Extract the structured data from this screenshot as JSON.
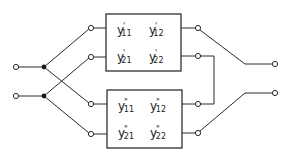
{
  "diagram": {
    "colors": {
      "line": "#2a2a2a",
      "background": "#ffffff"
    },
    "top_network": {
      "name": "two-port-1",
      "prime": "'",
      "params": [
        {
          "base": "y",
          "prime": "'",
          "index": "11"
        },
        {
          "base": "y",
          "prime": "'",
          "index": "12"
        },
        {
          "base": "y",
          "prime": "'",
          "index": "21"
        },
        {
          "base": "y",
          "prime": "'",
          "index": "22"
        }
      ]
    },
    "bottom_network": {
      "name": "two-port-2",
      "prime": "\"",
      "params": [
        {
          "base": "y",
          "prime": "\"",
          "index": "11"
        },
        {
          "base": "y",
          "prime": "\"",
          "index": "12"
        },
        {
          "base": "y",
          "prime": "\"",
          "index": "21"
        },
        {
          "base": "y",
          "prime": "\"",
          "index": "22"
        }
      ]
    },
    "terminals": {
      "input": 2,
      "output": 2
    }
  }
}
